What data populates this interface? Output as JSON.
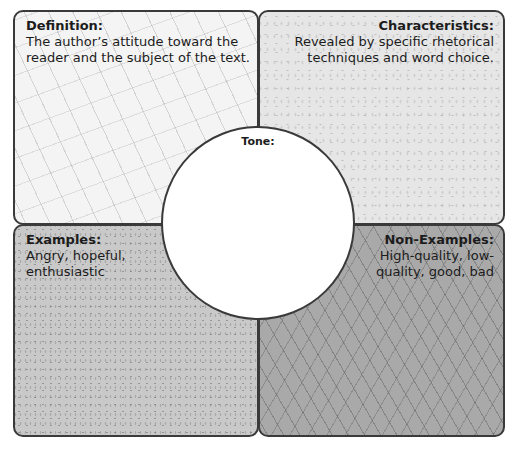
{
  "frayer_model": {
    "center": {
      "label": "Tone:"
    },
    "definition": {
      "heading": "Definition:",
      "body": "The author’s attitude toward the reader and the subject of the text."
    },
    "characteristics": {
      "heading": "Characteristics:",
      "body": "Revealed by specific rhetorical techniques and word choice."
    },
    "examples": {
      "heading": "Examples:",
      "body": "Angry, hopeful, enthusiastic"
    },
    "non_examples": {
      "heading": "Non-Examples:",
      "body": "High-quality, low-quality, good, bad"
    }
  },
  "colors": {
    "border": "#3a3a3a",
    "definition_bg": "#f4f4f4",
    "characteristics_bg": "#e6e6e6",
    "examples_bg": "#c9c9c9",
    "non_examples_bg": "#a9a9a9",
    "center_bg": "#ffffff"
  }
}
